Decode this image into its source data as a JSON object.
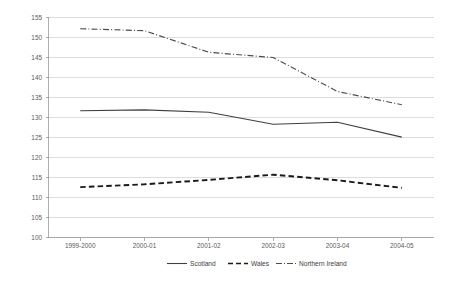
{
  "chart_data": {
    "type": "line",
    "title": "",
    "xlabel": "",
    "ylabel": "",
    "categories": [
      "1999-2000",
      "2000-01",
      "2001-02",
      "2002-03",
      "2003-04",
      "2004-05"
    ],
    "series": [
      {
        "name": "Scotland",
        "style": "solid",
        "color": "#404040",
        "values": [
          131.7,
          131.9,
          131.3,
          128.3,
          128.8,
          125.1
        ]
      },
      {
        "name": "Wales",
        "style": "dashed",
        "color": "#1a1a1a",
        "values": [
          112.6,
          113.3,
          114.4,
          115.7,
          114.3,
          112.4
        ]
      },
      {
        "name": "Northern Ireland",
        "style": "dash-dot",
        "color": "#4d4d4d",
        "values": [
          152.2,
          151.7,
          146.3,
          145.0,
          136.5,
          133.2
        ]
      }
    ],
    "ylim": [
      100,
      155
    ],
    "ystep": 5,
    "yticks": [
      100,
      105,
      110,
      115,
      120,
      125,
      130,
      135,
      140,
      145,
      150,
      155
    ],
    "grid": true,
    "legend_position": "bottom"
  },
  "axis": {
    "y_labels": [
      "155",
      "150",
      "145",
      "140",
      "135",
      "130",
      "125",
      "120",
      "115",
      "110",
      "105",
      "100"
    ],
    "x_labels": [
      "1999-2000",
      "2000-01",
      "2001-02",
      "2002-03",
      "2003-04",
      "2004-05"
    ]
  },
  "legend": {
    "items": [
      {
        "label": "Scotland",
        "style": "solid"
      },
      {
        "label": "Wales",
        "style": "dashed"
      },
      {
        "label": "Northern Ireland",
        "style": "dash-dot"
      }
    ]
  },
  "colors": {
    "gridline": "#cfcfcf",
    "axis": "#9a9a9a",
    "scotland": "#404040",
    "wales": "#1a1a1a",
    "northern_ireland": "#4d4d4d",
    "text": "#595959",
    "background": "#ffffff"
  }
}
